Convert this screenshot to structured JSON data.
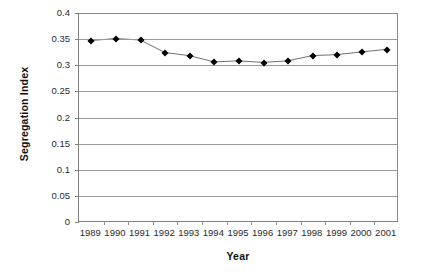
{
  "chart_data": {
    "type": "line",
    "title": "",
    "xlabel": "Year",
    "ylabel": "Segregation Index",
    "categories": [
      "1989",
      "1990",
      "1991",
      "1992",
      "1993",
      "1994",
      "1995",
      "1996",
      "1997",
      "1998",
      "1999",
      "2000",
      "2001"
    ],
    "values": [
      0.347,
      0.351,
      0.348,
      0.324,
      0.318,
      0.306,
      0.308,
      0.305,
      0.308,
      0.318,
      0.32,
      0.325,
      0.33
    ],
    "series": [
      {
        "name": "Segregation Index",
        "values": [
          0.347,
          0.351,
          0.348,
          0.324,
          0.318,
          0.306,
          0.308,
          0.305,
          0.308,
          0.318,
          0.32,
          0.325,
          0.33
        ]
      }
    ],
    "ylim": [
      0,
      0.4
    ],
    "y_ticks": [
      "0",
      "0.05",
      "0.1",
      "0.15",
      "0.2",
      "0.25",
      "0.3",
      "0.35",
      "0.4"
    ],
    "y_tick_values": [
      0,
      0.05,
      0.1,
      0.15,
      0.2,
      0.25,
      0.3,
      0.35,
      0.4
    ],
    "grid": true,
    "grid_axis": "y",
    "legend": false,
    "legend_position": "none",
    "marker": "diamond",
    "marker_color": "#000000",
    "line_color": "#6f6f6f",
    "gridline_color": "#9a9a9a",
    "axis_color": "#808080",
    "background_color": "#ffffff"
  }
}
